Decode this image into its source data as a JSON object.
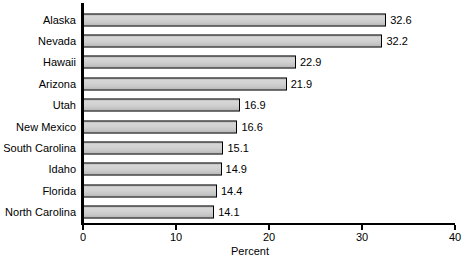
{
  "chart_data": {
    "type": "bar",
    "orientation": "horizontal",
    "title": "",
    "xlabel": "Percent",
    "ylabel": "",
    "xlim": [
      0,
      40
    ],
    "xticks": [
      0,
      10,
      20,
      30,
      40
    ],
    "xtick_labels": [
      "0",
      "10",
      "20",
      "30",
      "40"
    ],
    "grid": false,
    "legend": null,
    "bar_color": "#cdcdcd",
    "bar_edge_color": "#000000",
    "axis_color": "#000000",
    "categories": [
      "Alaska",
      "Nevada",
      "Hawaii",
      "Arizona",
      "Utah",
      "New Mexico",
      "South Carolina",
      "Idaho",
      "Florida",
      "North Carolina"
    ],
    "values": [
      32.6,
      32.2,
      22.9,
      21.9,
      16.9,
      16.6,
      15.1,
      14.9,
      14.4,
      14.1
    ],
    "data_labels": [
      "32.6",
      "32.2",
      "22.9",
      "21.9",
      "16.9",
      "16.6",
      "15.1",
      "14.9",
      "14.4",
      "14.1"
    ]
  }
}
